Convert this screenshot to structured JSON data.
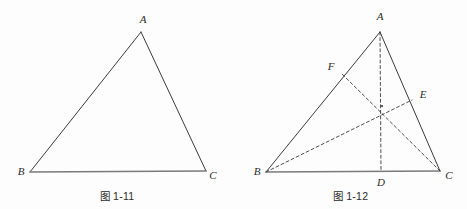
{
  "page": {
    "background_color": "#fdfdfd",
    "stroke_color": "#3a3a3a",
    "base_stroke_color": "#7a7a7a",
    "label_color": "#2b2b2b"
  },
  "figures": [
    {
      "id": "fig-1-11",
      "caption": "图 1-11",
      "caption_prefix": "图",
      "caption_number": "1-11",
      "description": "Scalene triangle ABC",
      "points": {
        "A": {
          "label": "A",
          "x": 141,
          "y": 32,
          "label_x": 143,
          "label_y": 20
        },
        "B": {
          "label": "B",
          "x": 30,
          "y": 172,
          "label_x": 21,
          "label_y": 172
        },
        "C": {
          "label": "C",
          "x": 206,
          "y": 171,
          "label_x": 213,
          "label_y": 176
        }
      },
      "solid_edges": [
        {
          "name": "side-AB",
          "from": "A",
          "to": "B"
        },
        {
          "name": "side-AC",
          "from": "A",
          "to": "C"
        }
      ],
      "base_edges": [
        {
          "name": "side-BC",
          "from": "B",
          "to": "C"
        }
      ],
      "dashed_edges": []
    },
    {
      "id": "fig-1-12",
      "caption": "图 1-12",
      "caption_prefix": "图",
      "caption_number": "1-12",
      "description": "Triangle ABC with three medians AD, BE, CF meeting at the centroid",
      "points": {
        "A": {
          "label": "A",
          "x": 380,
          "y": 32,
          "label_x": 380,
          "label_y": 17
        },
        "B": {
          "label": "B",
          "x": 266,
          "y": 172,
          "label_x": 257,
          "label_y": 172
        },
        "C": {
          "label": "C",
          "x": 440,
          "y": 171,
          "label_x": 449,
          "label_y": 176
        },
        "D": {
          "label": "D",
          "x": 381,
          "y": 171,
          "label_x": 381,
          "label_y": 183
        },
        "E": {
          "label": "E",
          "x": 412,
          "y": 100,
          "label_x": 423,
          "label_y": 95
        },
        "F": {
          "label": "F",
          "x": 341,
          "y": 73,
          "label_x": 331,
          "label_y": 67
        },
        "G": {
          "label": "",
          "x": 382,
          "y": 106,
          "label_x": 382,
          "label_y": 106
        }
      },
      "solid_edges": [
        {
          "name": "side-AB",
          "from": "A",
          "to": "B"
        },
        {
          "name": "side-AC",
          "from": "A",
          "to": "C"
        }
      ],
      "base_edges": [
        {
          "name": "side-BC",
          "from": "B",
          "to": "C"
        }
      ],
      "dashed_edges": [
        {
          "name": "median-AD",
          "from": "A",
          "to": "D"
        },
        {
          "name": "median-BE",
          "from": "B",
          "to": "E"
        },
        {
          "name": "median-CF",
          "from": "C",
          "to": "F"
        }
      ]
    }
  ]
}
